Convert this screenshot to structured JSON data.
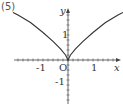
{
  "problem_label": "(5)",
  "chart_data": {
    "type": "line",
    "title": "",
    "xlabel": "x",
    "ylabel": "y",
    "origin_label": "O",
    "x_tick_labels": [
      "-1",
      "1"
    ],
    "y_tick_labels": [
      "1",
      "-1"
    ],
    "xlim": [
      -2.2,
      2.2
    ],
    "ylim": [
      -2.0,
      2.4
    ],
    "grid": false,
    "legend": null,
    "series": [
      {
        "name": "curve",
        "x": [
          -2.2,
          -2.0,
          -1.5,
          -1.0,
          -0.6,
          -0.3,
          -0.1,
          0,
          0.1,
          0.3,
          0.6,
          1.0,
          1.5,
          2.0,
          2.2
        ],
        "y": [
          1.9,
          1.8,
          1.5,
          1.1,
          0.75,
          0.45,
          0.2,
          0,
          0.2,
          0.45,
          0.75,
          1.1,
          1.5,
          1.8,
          1.9
        ]
      }
    ],
    "color": "#333333"
  }
}
